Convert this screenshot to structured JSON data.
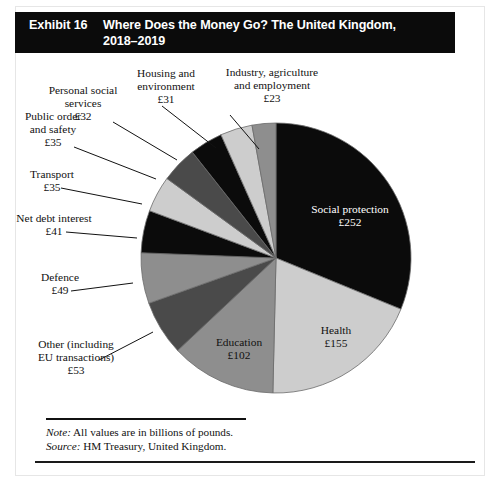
{
  "header": {
    "exhibit_number": "Exhibit 16",
    "title": "Where Does the Money Go? The United Kingdom, 2018–2019"
  },
  "footnote": {
    "note_label": "Note:",
    "note_text": " All values are in billions of pounds.",
    "source_label": "Source:",
    "source_text": " HM Treasury, United Kingdom."
  },
  "labels": {
    "social_protection": "Social protection",
    "social_protection_value": "£252",
    "health": "Health",
    "health_value": "£155",
    "education": "Education",
    "education_value": "£102",
    "other_l1": "Other (including",
    "other_l2": "EU transactions)",
    "other_value": "£53",
    "defence": "Defence",
    "defence_value": "£49",
    "net_debt": "Net debt interest",
    "net_debt_value": "£41",
    "transport": "Transport",
    "transport_value": "£35",
    "public_order_l1": "Public order",
    "public_order_l2": "and safety",
    "public_order_value": "£35",
    "personal_social_l1": "Personal social",
    "personal_social_l2": "services",
    "personal_social_value": "£32",
    "housing_l1": "Housing and",
    "housing_l2": "environment",
    "housing_value": "£31",
    "industry_l1": "Industry, agriculture",
    "industry_l2": "and employment",
    "industry_value": "£23"
  },
  "colors": {
    "black": "#0b0b0b",
    "dark_gray": "#4a4a4a",
    "mid_gray": "#8e8e8e",
    "light_gray": "#cdcdcd",
    "header_bg": "#0b0b0b",
    "header_text": "#ffffff",
    "outline": "#6b6b6b"
  },
  "chart_data": {
    "type": "pie",
    "title": "Where Does the Money Go? The United Kingdom, 2018–2019",
    "unit": "billions of pounds (£)",
    "total": 808,
    "start_angle_deg": 0,
    "direction": "clockwise",
    "legend": "none (direct labels with leader lines)",
    "categories": [
      "Social protection",
      "Health",
      "Education",
      "Other (including EU transactions)",
      "Defence",
      "Net debt interest",
      "Transport",
      "Public order and safety",
      "Personal social services",
      "Housing and environment",
      "Industry, agriculture and employment"
    ],
    "values": [
      252,
      155,
      102,
      53,
      49,
      41,
      35,
      35,
      32,
      31,
      23
    ],
    "value_labels": [
      "£252",
      "£155",
      "£102",
      "£53",
      "£49",
      "£41",
      "£35",
      "£35",
      "£32",
      "£31",
      "£23"
    ],
    "slice_colors": [
      "#0b0b0b",
      "#cdcdcd",
      "#8e8e8e",
      "#4a4a4a",
      "#8e8e8e",
      "#0b0b0b",
      "#cdcdcd",
      "#4a4a4a",
      "#0b0b0b",
      "#cdcdcd",
      "#8e8e8e"
    ],
    "percentages": [
      31.2,
      19.2,
      12.6,
      6.6,
      6.1,
      5.1,
      4.3,
      4.3,
      4.0,
      3.8,
      2.8
    ]
  }
}
